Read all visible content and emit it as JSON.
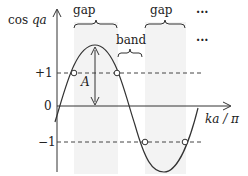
{
  "diagram": {
    "y_axis_label_prefix": "cos ",
    "y_axis_label_var": "qa",
    "x_axis_label": "ka / π",
    "tick_plus1": "+1",
    "tick_zero": "0",
    "tick_minus1": "−1",
    "amplitude_label": "A",
    "gap_label_1": "gap",
    "gap_label_2": "gap",
    "band_label": "band",
    "ellipsis_1": "···",
    "ellipsis_2": "···",
    "colors": {
      "line": "#333333",
      "shade": "#f2f2f2",
      "dashed": "#444444"
    }
  }
}
